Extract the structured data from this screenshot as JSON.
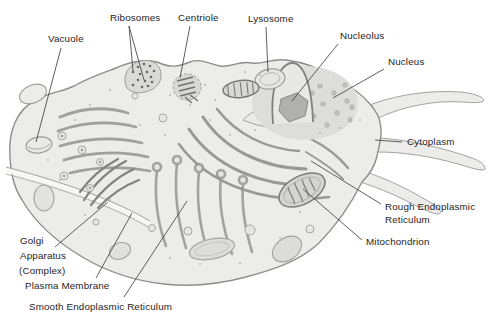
{
  "figure": {
    "kind": "animal-cell-cutaway-diagram",
    "colors": {
      "background": "#ffffff",
      "cell_fill": "#ececea",
      "cell_outline": "#9a9a98",
      "nucleus_fill": "#dddddb",
      "nucleolus_fill": "#b0b0ae",
      "leader_line": "#4c4c4c",
      "label_text": "#1e1e1e"
    }
  },
  "labels": {
    "vacuole": "Vacuole",
    "ribosomes": "Ribosomes",
    "centriole": "Centriole",
    "lysosome": "Lysosome",
    "nucleolus": "Nucleolus",
    "nucleus": "Nucleus",
    "cytoplasm": "Cytoplasm",
    "rough_er_1": "Rough Endoplasmic",
    "rough_er_2": "Reticulum",
    "mitochondrion": "Mitochondrion",
    "golgi_1": "Golgi",
    "golgi_2": "Apparatus",
    "golgi_3": "(Complex)",
    "plasma_membrane": "Plasma Membrane",
    "smooth_er": "Smooth Endoplasmic Reticulum"
  }
}
